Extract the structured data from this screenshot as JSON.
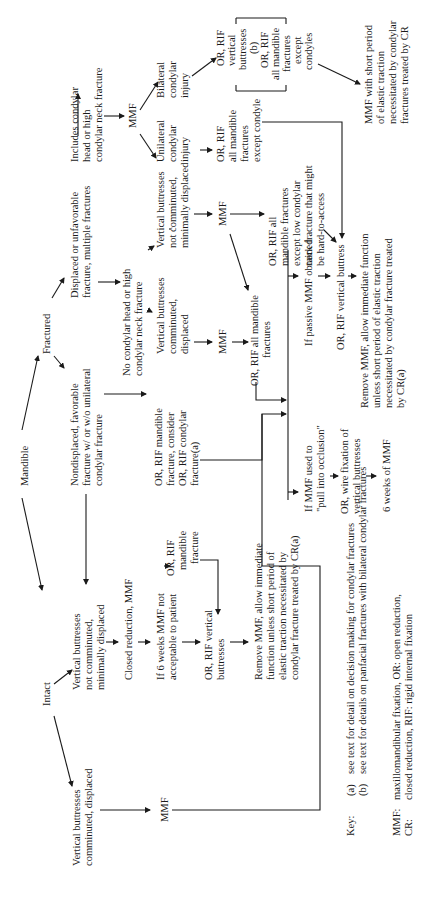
{
  "diagram": {
    "orientation": "rotated-90-ccw",
    "nodes": {
      "mandible": {
        "lines": [
          "Mandible"
        ]
      },
      "fractured": {
        "lines": [
          "Fractured"
        ]
      },
      "intact": {
        "lines": [
          "Intact"
        ]
      },
      "displaced": {
        "lines": [
          "Displaced or unfavorable",
          "fracture, multiple fractures"
        ]
      },
      "nondisplaced": {
        "lines": [
          "Nondisplaced, favorable",
          "fracture w/ or w/o unilateral",
          "condylar fracture"
        ]
      },
      "includes_condylar": {
        "lines": [
          "Includes condylar",
          "head or high",
          "condylar neck fracture"
        ]
      },
      "no_condylar": {
        "lines": [
          "No condylar head or high",
          "condylar neck fracture"
        ]
      },
      "mmf_top": {
        "lines": [
          "MMF"
        ]
      },
      "bilateral": {
        "lines": [
          "Bilateral",
          "condylar",
          "injury"
        ]
      },
      "unilateral": {
        "lines": [
          "Unilateral",
          "condylar",
          "injury"
        ]
      },
      "or_rif_vertical_b": {
        "lines": [
          "OR, RIF",
          "vertical",
          "buttresses",
          "(b)",
          "OR, RIF",
          "all mandible",
          "fractures",
          "except",
          "condyles"
        ]
      },
      "or_rif_all_except_condyle": {
        "lines": [
          "OR, RIF",
          "all mandible",
          "fractures",
          "except  condyle"
        ]
      },
      "mmf_short_period": {
        "lines": [
          "MMF with short period",
          "of elastic traction",
          "necessitated by condylar",
          "fractures treated by CR"
        ]
      },
      "vb_not_comminuted_fx": {
        "lines": [
          "Vertical buttresses",
          "not comminuted,",
          "minimally displaced"
        ]
      },
      "vb_comminuted_fx": {
        "lines": [
          "Vertical buttresses",
          "comminuted,",
          "displaced"
        ]
      },
      "mmf_mid1": {
        "lines": [
          "MMF"
        ]
      },
      "mmf_mid2": {
        "lines": [
          "MMF"
        ]
      },
      "or_rif_all_except_low": {
        "lines": [
          "OR, RIF all",
          "mandible fractures",
          "except  low condylar",
          "neck fracture that might",
          "be hard-to-access"
        ]
      },
      "or_rif_all_mandible": {
        "lines": [
          "OR, RIF all mandible",
          "fractures"
        ]
      },
      "or_rif_consider": {
        "lines": [
          "OR, RIF mandible",
          "fracture, consider",
          "OR, RIF condylar",
          "fracture(a)"
        ]
      },
      "if_passive": {
        "lines": [
          "If passive MMF obtained"
        ]
      },
      "or_rif_vertical_buttress": {
        "lines": [
          "OR, RIF vertical buttress"
        ]
      },
      "remove_mmf_right": {
        "lines": [
          "Remove MMF, allow immediate  function",
          "unless short period of elastic traction",
          "necessitated by condylar fracture treated",
          "by CR(a)"
        ]
      },
      "if_mmf_pull": {
        "lines": [
          "If MMF used to",
          "\"pull into occlusion\""
        ]
      },
      "or_wire": {
        "lines": [
          "OR, wire fixation of",
          "vertical buttresses"
        ]
      },
      "six_weeks": {
        "lines": [
          "6 weeks of MMF"
        ]
      },
      "vb_not_comminuted_intact": {
        "lines": [
          "Vertical buttresses",
          "not comminuted,",
          "minimally displaced"
        ]
      },
      "closed_reduction": {
        "lines": [
          "Closed reduction, MMF"
        ]
      },
      "if_6_weeks": {
        "lines": [
          "If 6 weeks MMF not",
          "acceptable to patient"
        ]
      },
      "or_rif_mandible_fx": {
        "lines": [
          "OR, RIF",
          "mandible",
          "fracture"
        ]
      },
      "or_rif_vb_intact": {
        "lines": [
          "OR, RIF vertical",
          "buttresses"
        ]
      },
      "remove_mmf_left": {
        "lines": [
          "Remove MMF, allow immediate",
          "function unless short period of",
          "elastic traction necessitated by",
          "condylar fracture treated by CR(a)"
        ]
      },
      "vb_comminuted_intact": {
        "lines": [
          "Vertical buttresses",
          "comminuted, displaced"
        ]
      },
      "mmf_bottom": {
        "lines": [
          "MMF"
        ]
      }
    },
    "key": {
      "label": "Key:",
      "notes": [
        {
          "mark": "(a)",
          "text": "see text for detail on decision making for condylar fractures"
        },
        {
          "mark": "(b)",
          "text": "see text for details on panfacial fractures with bilateral condylar fractures"
        }
      ],
      "abbreviations": [
        {
          "abbr": "MMF:",
          "text": "maxillomandibular fixation, OR: open reduction,"
        },
        {
          "abbr": "CR:",
          "text": "closed reduction, RIF: rigid internal fixation"
        }
      ]
    }
  }
}
